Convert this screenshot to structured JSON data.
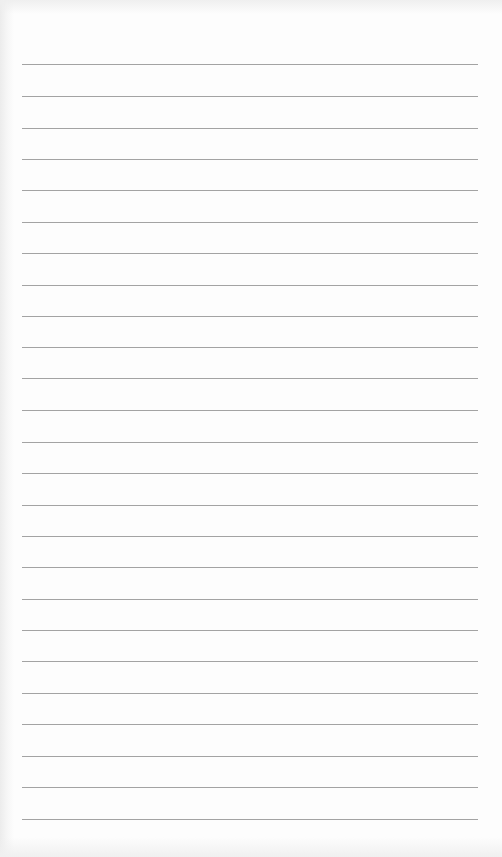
{
  "document": {
    "type": "lined-paper",
    "rule_count": 25,
    "rule_color": "#a3a3a3",
    "paper_color": "#fdfdfd",
    "rules_y": [
      64,
      96,
      128,
      159,
      190,
      222,
      253,
      285,
      316,
      347,
      378,
      410,
      442,
      473,
      505,
      536,
      567,
      599,
      630,
      661,
      693,
      724,
      756,
      787,
      819
    ],
    "rule_left": 22,
    "rule_width": 456
  }
}
